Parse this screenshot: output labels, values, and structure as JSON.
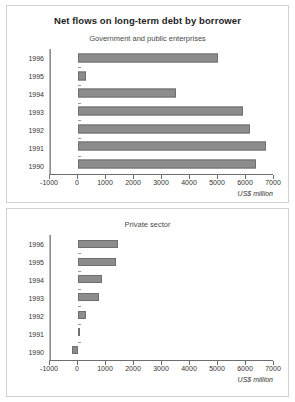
{
  "figure": {
    "title": "Net flows on long-term debt by borrower"
  },
  "chart_data": [
    {
      "type": "bar",
      "orientation": "horizontal",
      "title": "Net flows on long-term debt by borrower",
      "subtitle": "Government and public enterprises",
      "categories": [
        "1996",
        "1995",
        "1994",
        "1993",
        "1992",
        "1991",
        "1990"
      ],
      "values": [
        5000,
        300,
        3500,
        5900,
        6150,
        6700,
        6350
      ],
      "xlabel": "US$ million",
      "ylabel": "",
      "xlim": [
        -1000,
        7000
      ],
      "xticks": [
        -1000,
        0,
        1000,
        2000,
        3000,
        4000,
        5000,
        6000,
        7000
      ],
      "xtick_labels": [
        "-1000",
        "0",
        "1000",
        "2000",
        "3000",
        "4000",
        "5000",
        "6000",
        "7000"
      ],
      "grid": false,
      "legend": null,
      "bar_color": "#8c8c8c",
      "bar_edge_color": "#6f6f6f"
    },
    {
      "type": "bar",
      "orientation": "horizontal",
      "title": "",
      "subtitle": "Private sector",
      "categories": [
        "1996",
        "1995",
        "1994",
        "1993",
        "1992",
        "1991",
        "1990"
      ],
      "values": [
        1420,
        1360,
        840,
        750,
        280,
        60,
        -200
      ],
      "xlabel": "US$ million",
      "ylabel": "",
      "xlim": [
        -1000,
        7000
      ],
      "xticks": [
        -1000,
        0,
        1000,
        2000,
        3000,
        4000,
        5000,
        6000,
        7000
      ],
      "xtick_labels": [
        "-1000",
        "0",
        "1000",
        "2000",
        "3000",
        "4000",
        "5000",
        "6000",
        "7000"
      ],
      "grid": false,
      "legend": null,
      "bar_color": "#8c8c8c",
      "bar_edge_color": "#6f6f6f"
    }
  ]
}
